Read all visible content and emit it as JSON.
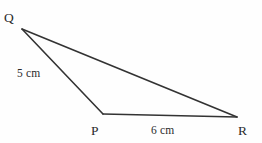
{
  "figure": {
    "type": "geometry-triangle-diagram",
    "background_color": "#fefefe",
    "stroke_color": "#333333",
    "text_color": "#2b2b2b",
    "width": 262,
    "height": 143,
    "vertices": [
      {
        "name": "Q",
        "label": "Q",
        "x": 22,
        "y": 29
      },
      {
        "name": "P",
        "label": "P",
        "x": 103,
        "y": 114
      },
      {
        "name": "R",
        "label": "R",
        "x": 237,
        "y": 117
      }
    ],
    "edges": [
      {
        "name": "QR",
        "from": "Q",
        "to": "R",
        "label": ""
      },
      {
        "name": "QP",
        "from": "Q",
        "to": "P",
        "label": "5 cm"
      },
      {
        "name": "PR",
        "from": "P",
        "to": "R",
        "label": "6 cm"
      }
    ],
    "labels": {
      "vertex_q": "Q",
      "vertex_p": "P",
      "vertex_r": "R",
      "side_qp_length": "5 cm",
      "side_pr_length": "6 cm"
    }
  }
}
